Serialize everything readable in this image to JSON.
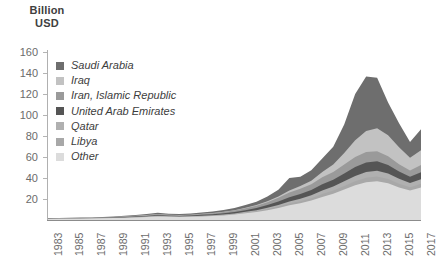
{
  "axis_title": {
    "line1": "Billion",
    "line2": "USD"
  },
  "legend": {
    "items": [
      {
        "label": "Saudi Arabia",
        "color": "#6e6e6e",
        "swatch_name": "legend-swatch-saudi-arabia"
      },
      {
        "label": "Iraq",
        "color": "#c2c2c2",
        "swatch_name": "legend-swatch-iraq"
      },
      {
        "label": "Iran, Islamic Republic",
        "color": "#9a9a9a",
        "swatch_name": "legend-swatch-iran"
      },
      {
        "label": "United Arab Emirates",
        "color": "#555555",
        "swatch_name": "legend-swatch-uae"
      },
      {
        "label": "Qatar",
        "color": "#b0b0b0",
        "swatch_name": "legend-swatch-qatar"
      },
      {
        "label": "Libya",
        "color": "#a8a8a8",
        "swatch_name": "legend-swatch-libya"
      },
      {
        "label": "Other",
        "color": "#dcdcdc",
        "swatch_name": "legend-swatch-other"
      }
    ]
  },
  "chart_data": {
    "type": "area",
    "stacked": true,
    "title": "",
    "subtitle": "",
    "xlabel": "",
    "ylabel": "Billion USD",
    "ylim": [
      0,
      160
    ],
    "ytick_step": 20,
    "yticks": [
      20,
      40,
      60,
      80,
      100,
      120,
      140,
      160
    ],
    "grid": false,
    "legend_position": "inside-top-left",
    "xlim": [
      1983,
      2017
    ],
    "xtick_step": 2,
    "xticks": [
      1983,
      1985,
      1987,
      1989,
      1991,
      1993,
      1995,
      1997,
      1999,
      2001,
      2003,
      2005,
      2007,
      2009,
      2011,
      2013,
      2015,
      2017
    ],
    "x": [
      1983,
      1984,
      1985,
      1986,
      1987,
      1988,
      1989,
      1990,
      1991,
      1992,
      1993,
      1994,
      1995,
      1996,
      1997,
      1998,
      1999,
      2000,
      2001,
      2002,
      2003,
      2004,
      2005,
      2006,
      2007,
      2008,
      2009,
      2010,
      2011,
      2012,
      2013,
      2014,
      2015,
      2016,
      2017
    ],
    "series": [
      {
        "name": "Saudi Arabia",
        "color": "#6e6e6e",
        "values": [
          0.2,
          0.2,
          0.3,
          0.3,
          0.3,
          0.4,
          0.5,
          0.6,
          0.8,
          0.9,
          1.2,
          1.0,
          0.9,
          1.0,
          1.2,
          1.4,
          1.6,
          2.0,
          2.6,
          3.2,
          4.5,
          6.5,
          12.0,
          9.0,
          10.0,
          13.0,
          17.0,
          27.0,
          44.0,
          52.0,
          48.0,
          31.0,
          23.0,
          15.0,
          20.0
        ]
      },
      {
        "name": "Iraq",
        "color": "#c2c2c2",
        "values": [
          0.1,
          0.1,
          0.1,
          0.1,
          0.1,
          0.1,
          0.1,
          0.1,
          0.1,
          0.1,
          0.1,
          0.1,
          0.1,
          0.1,
          0.2,
          0.2,
          0.3,
          0.4,
          0.5,
          0.6,
          0.8,
          1.2,
          2.0,
          2.5,
          3.5,
          5.0,
          7.0,
          11.0,
          16.0,
          20.0,
          22.0,
          20.0,
          16.0,
          12.0,
          14.0
        ]
      },
      {
        "name": "Iran, Islamic Republic",
        "color": "#9a9a9a",
        "values": [
          0.2,
          0.2,
          0.2,
          0.2,
          0.3,
          0.3,
          0.4,
          0.5,
          0.6,
          0.7,
          0.9,
          0.8,
          0.7,
          0.8,
          0.9,
          1.0,
          1.2,
          1.4,
          1.8,
          2.2,
          2.8,
          3.5,
          4.5,
          5.0,
          5.5,
          6.5,
          7.5,
          8.5,
          9.5,
          10.0,
          9.5,
          8.5,
          7.0,
          6.0,
          7.0
        ]
      },
      {
        "name": "United Arab Emirates",
        "color": "#555555",
        "values": [
          0.2,
          0.2,
          0.2,
          0.2,
          0.2,
          0.3,
          0.3,
          0.4,
          0.5,
          0.6,
          0.7,
          0.6,
          0.6,
          0.7,
          0.8,
          0.9,
          1.1,
          1.3,
          1.6,
          2.0,
          2.5,
          3.2,
          4.0,
          4.5,
          5.0,
          6.0,
          6.5,
          7.5,
          8.5,
          9.0,
          9.0,
          8.0,
          7.0,
          6.0,
          6.5
        ]
      },
      {
        "name": "Qatar",
        "color": "#b0b0b0",
        "values": [
          0.1,
          0.1,
          0.1,
          0.1,
          0.1,
          0.1,
          0.2,
          0.2,
          0.2,
          0.3,
          0.3,
          0.3,
          0.3,
          0.3,
          0.4,
          0.4,
          0.5,
          0.6,
          0.8,
          1.0,
          1.3,
          1.6,
          2.0,
          2.4,
          2.8,
          3.4,
          3.8,
          4.4,
          5.0,
          5.4,
          5.6,
          5.2,
          4.6,
          4.0,
          4.4
        ]
      },
      {
        "name": "Libya",
        "color": "#a8a8a8",
        "values": [
          0.1,
          0.1,
          0.1,
          0.1,
          0.1,
          0.1,
          0.1,
          0.2,
          0.2,
          0.2,
          0.3,
          0.2,
          0.2,
          0.2,
          0.3,
          0.3,
          0.4,
          0.5,
          0.6,
          0.8,
          1.0,
          1.3,
          1.6,
          1.9,
          2.2,
          2.7,
          3.0,
          3.5,
          4.0,
          4.3,
          4.4,
          4.1,
          3.6,
          3.2,
          3.5
        ]
      },
      {
        "name": "Other",
        "color": "#dcdcdc",
        "values": [
          1.0,
          1.1,
          1.2,
          1.3,
          1.4,
          1.6,
          1.8,
          2.0,
          2.4,
          2.8,
          3.4,
          3.0,
          2.8,
          3.0,
          3.4,
          3.8,
          4.4,
          5.2,
          6.4,
          7.6,
          9.4,
          11.5,
          14.0,
          16.0,
          18.5,
          22.0,
          25.0,
          29.0,
          33.0,
          36.0,
          37.0,
          35.0,
          31.0,
          28.0,
          31.0
        ]
      }
    ]
  }
}
